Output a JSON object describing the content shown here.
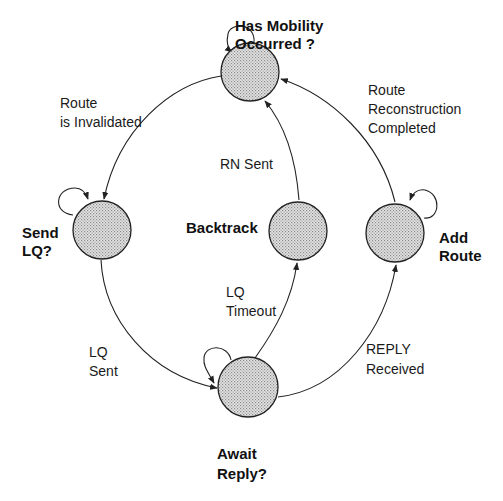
{
  "diagram": {
    "type": "state-transition",
    "colors": {
      "stroke": "#222222",
      "fill": "#d8d8d8",
      "text": "#111111",
      "background": "#ffffff"
    },
    "states": [
      {
        "id": "has_mobility",
        "line1": "Has Mobility",
        "line2": "Occurred ?"
      },
      {
        "id": "send_lq",
        "line1": "Send",
        "line2": "LQ?"
      },
      {
        "id": "backtrack",
        "line1": "Backtrack"
      },
      {
        "id": "add_route",
        "line1": "Add",
        "line2": "Route"
      },
      {
        "id": "await_reply",
        "line1": "Await",
        "line2": "Reply?"
      }
    ],
    "transitions": [
      {
        "from": "has_mobility",
        "to": "send_lq",
        "line1": "Route",
        "line2": "is Invalidated"
      },
      {
        "from": "send_lq",
        "to": "await_reply",
        "line1": "LQ",
        "line2": "Sent"
      },
      {
        "from": "await_reply",
        "to": "backtrack",
        "line1": "LQ",
        "line2": "Timeout"
      },
      {
        "from": "backtrack",
        "to": "has_mobility",
        "line1": "RN Sent"
      },
      {
        "from": "await_reply",
        "to": "add_route",
        "line1": "REPLY",
        "line2": "Received"
      },
      {
        "from": "add_route",
        "to": "has_mobility",
        "line1": "Route",
        "line2": "Reconstruction",
        "line3": "Completed"
      }
    ],
    "self_loops": [
      "has_mobility",
      "send_lq",
      "add_route",
      "await_reply"
    ]
  }
}
